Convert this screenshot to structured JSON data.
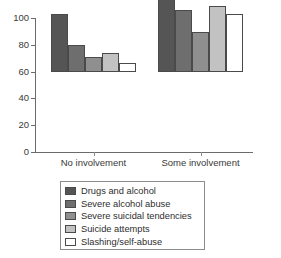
{
  "chart_data": {
    "type": "bar",
    "title": "",
    "subtitle": "",
    "xlabel": "",
    "ylabel": "",
    "categories": [
      "No involvement",
      "Some involvement"
    ],
    "series": [
      {
        "name": "Drugs and alcohol",
        "color": "#555555",
        "values": [
          43,
          85
        ]
      },
      {
        "name": "Severe alcohol abuse",
        "color": "#6e6e6e",
        "values": [
          20,
          46.5
        ]
      },
      {
        "name": "Severe suicidal tendencies",
        "color": "#8f8f8f",
        "values": [
          11,
          29.5
        ]
      },
      {
        "name": "Suicide attempts",
        "color": "#c2c2c2",
        "values": [
          14,
          49
        ]
      },
      {
        "name": "Slashing/self-abuse",
        "color": "#ffffff",
        "values": [
          7,
          43.5
        ]
      }
    ],
    "ylim": [
      0,
      100
    ],
    "yticks": [
      0,
      20,
      40,
      60,
      80,
      100
    ],
    "ytick_labels": [
      "0",
      "20",
      "40",
      "60",
      "80",
      "100"
    ],
    "grid": false,
    "legend_position": "bottom"
  },
  "legend": {
    "items": [
      {
        "label": "Drugs and alcohol",
        "color": "#555555"
      },
      {
        "label": "Severe alcohol abuse",
        "color": "#6e6e6e"
      },
      {
        "label": "Severe suicidal tendencies",
        "color": "#8f8f8f"
      },
      {
        "label": "Suicide attempts",
        "color": "#c2c2c2"
      },
      {
        "label": "Slashing/self-abuse",
        "color": "#ffffff"
      }
    ]
  }
}
